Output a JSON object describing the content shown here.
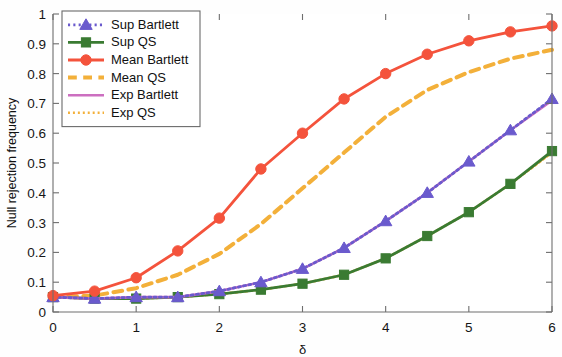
{
  "chart_data": {
    "type": "line",
    "title": "",
    "xlabel": "δ",
    "ylabel": "Null rejection frequency",
    "xlim": [
      0,
      6
    ],
    "ylim": [
      0,
      1
    ],
    "xticks": [
      "0",
      "1",
      "2",
      "3",
      "4",
      "5",
      "6"
    ],
    "xtick_values": [
      0,
      1,
      2,
      3,
      4,
      5,
      6
    ],
    "yticks": [
      "0",
      "0.1",
      "0.2",
      "0.3",
      "0.4",
      "0.5",
      "0.6",
      "0.7",
      "0.8",
      "0.9",
      "1"
    ],
    "ytick_values": [
      0,
      0.1,
      0.2,
      0.3,
      0.4,
      0.5,
      0.6,
      0.7,
      0.8,
      0.9,
      1
    ],
    "grid": false,
    "legend_position": "top-left",
    "x": [
      0,
      0.5,
      1,
      1.5,
      2,
      2.5,
      3,
      3.5,
      4,
      4.5,
      5,
      5.5,
      6
    ],
    "series": [
      {
        "name": "Sup Bartlett",
        "color": "#6a5acd",
        "line_style": "dotted",
        "marker": "triangle",
        "marker_color": "#6a5acd",
        "values": [
          0.05,
          0.045,
          0.05,
          0.05,
          0.07,
          0.1,
          0.145,
          0.215,
          0.305,
          0.4,
          0.505,
          0.61,
          0.715
        ]
      },
      {
        "name": "Sup QS",
        "color": "#3a7b32",
        "line_style": "solid",
        "marker": "square",
        "marker_color": "#3a7b32",
        "values": [
          0.05,
          0.045,
          0.045,
          0.05,
          0.06,
          0.075,
          0.095,
          0.125,
          0.18,
          0.255,
          0.335,
          0.43,
          0.54
        ]
      },
      {
        "name": "Mean Bartlett",
        "color": "#f4533c",
        "line_style": "solid",
        "marker": "circle",
        "marker_color": "#f4533c",
        "values": [
          0.055,
          0.07,
          0.115,
          0.205,
          0.315,
          0.48,
          0.6,
          0.715,
          0.8,
          0.865,
          0.91,
          0.94,
          0.96
        ]
      },
      {
        "name": "Mean QS",
        "color": "#f3b03a",
        "line_style": "dashed",
        "marker": "none",
        "marker_color": "#f3b03a",
        "values": [
          0.05,
          0.055,
          0.08,
          0.125,
          0.195,
          0.295,
          0.415,
          0.535,
          0.655,
          0.745,
          0.805,
          0.85,
          0.88
        ]
      },
      {
        "name": "Exp Bartlett",
        "color": "#cc6fc0",
        "line_style": "solid",
        "marker": "none",
        "marker_color": "#cc6fc0",
        "values": [
          0.05,
          0.045,
          0.05,
          0.05,
          0.07,
          0.1,
          0.145,
          0.215,
          0.305,
          0.4,
          0.505,
          0.61,
          0.71
        ]
      },
      {
        "name": "Exp QS",
        "color": "#f3b03a",
        "line_style": "dotted",
        "marker": "none",
        "marker_color": "#f3b03a",
        "values": [
          0.05,
          0.045,
          0.045,
          0.05,
          0.06,
          0.075,
          0.095,
          0.125,
          0.18,
          0.255,
          0.335,
          0.43,
          0.535
        ]
      }
    ]
  },
  "axes": {
    "y_label": "Null rejection frequency",
    "x_label": "δ"
  },
  "legend": {
    "entries": [
      {
        "label": "Sup Bartlett"
      },
      {
        "label": "Sup QS"
      },
      {
        "label": "Mean Bartlett"
      },
      {
        "label": "Mean QS"
      },
      {
        "label": "Exp Bartlett"
      },
      {
        "label": "Exp QS"
      }
    ]
  }
}
